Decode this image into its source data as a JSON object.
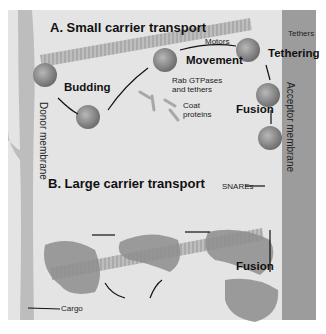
{
  "figure": {
    "panel_a_title": "A. Small carrier transport",
    "panel_b_title": "B. Large carrier transport",
    "steps": {
      "budding": "Budding",
      "movement": "Movement",
      "tethering": "Tethering",
      "fusion_a": "Fusion",
      "fusion_b": "Fusion"
    },
    "annotations": {
      "motors": "Motors",
      "tethers": "Tethers",
      "rab": "Rab GTPases\nand tethers",
      "rab_line1": "Rab GTPases",
      "rab_line2": "and tethers",
      "coat_line1": "Coat",
      "coat_line2": "proteins",
      "snares": "SNAREs",
      "cargo": "Cargo"
    },
    "membranes": {
      "donor": "Donor membrane",
      "acceptor": "Acceptor membrane"
    },
    "colors": {
      "background": "#e6e6e6",
      "membrane": "#b9b9b9",
      "acceptor_membrane": "#9a9a9a",
      "microtubule": "#b0b0b0",
      "vesicle": "#8a8a8a"
    }
  }
}
